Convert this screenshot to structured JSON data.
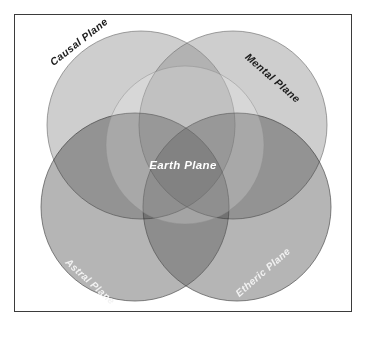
{
  "diagram": {
    "type": "venn",
    "frame": {
      "border_color": "#3b3b3b",
      "background_color": "#ffffff"
    },
    "labels": {
      "causal": "Causal Plane",
      "mental": "Mental Plane",
      "astral": "Astral Plane",
      "etheric": "Etheric Plane",
      "earth": "Earth Plane"
    },
    "circles": [
      {
        "id": "causal",
        "label": "Causal Plane",
        "cx": 126,
        "cy": 110,
        "r": 94,
        "fill": "#8f8f8f",
        "opacity": 0.45,
        "stroke": "#6f6f6f",
        "label_color": "#1c1c1c",
        "label_rotation": -38
      },
      {
        "id": "mental",
        "label": "Mental Plane",
        "cx": 218,
        "cy": 110,
        "r": 94,
        "fill": "#8f8f8f",
        "opacity": 0.45,
        "stroke": "#6f6f6f",
        "label_color": "#1c1c1c",
        "label_rotation": 41
      },
      {
        "id": "astral",
        "label": "Astral Plane",
        "cx": 120,
        "cy": 192,
        "r": 94,
        "fill": "#5a5a5a",
        "opacity": 0.45,
        "stroke": "#585858",
        "label_color": "#f2f2f2",
        "label_rotation": 42
      },
      {
        "id": "etheric",
        "label": "Etheric Plane",
        "cx": 222,
        "cy": 192,
        "r": 94,
        "fill": "#5a5a5a",
        "opacity": 0.45,
        "stroke": "#585858",
        "label_color": "#f2f2f2",
        "label_rotation": -41
      },
      {
        "id": "earth",
        "label": "Earth Plane",
        "cx": 170,
        "cy": 130,
        "r": 79,
        "fill": "#cfcfcf",
        "opacity": 0.34,
        "stroke": "#9a9a9a",
        "label_color": "#ffffff",
        "label_rotation": 0
      }
    ],
    "palette": {
      "upper_circle_tone": "#d8d8d8",
      "upper_overlap_tone": "#c3c3c3",
      "lower_circle_tone": "#8a8a8a",
      "center_earth_tone": "#9b9b9b",
      "darkest_overlap_tone": "#4a4a4a",
      "outline_tone": "#6f6f6f"
    }
  }
}
